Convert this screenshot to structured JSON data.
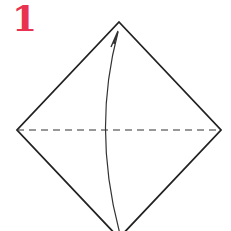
{
  "step": {
    "number": "1",
    "color": "#e8324f"
  },
  "diagram": {
    "shape": "diamond",
    "line_color": "#222222",
    "vertices": {
      "top": [
        119,
        22
      ],
      "right": [
        221,
        130
      ],
      "bottom": [
        119,
        238
      ],
      "left": [
        17,
        130
      ]
    },
    "fold_line": {
      "style": "dashed",
      "from": [
        17,
        130
      ],
      "to": [
        221,
        130
      ]
    },
    "arrow": {
      "direction": "up",
      "from": [
        120,
        234
      ],
      "to": [
        118,
        31
      ]
    }
  }
}
